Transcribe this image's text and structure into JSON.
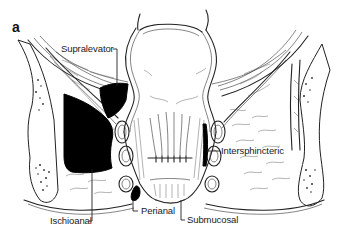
{
  "figure": {
    "panel_label": "a",
    "colors": {
      "ink": "#222222",
      "abscess_fill": "#000000",
      "background": "#ffffff"
    },
    "labels": [
      {
        "id": "supralevator",
        "text": "Supralevator"
      },
      {
        "id": "intersphincteric",
        "text": "Intersphincteric"
      },
      {
        "id": "ischioanal",
        "text": "Ischioanal"
      },
      {
        "id": "perianal",
        "text": "Perianal"
      },
      {
        "id": "submucosal",
        "text": "Submucosal"
      }
    ]
  }
}
